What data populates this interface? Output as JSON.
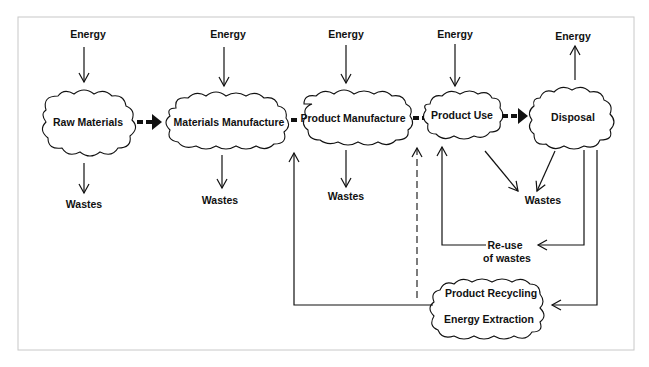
{
  "diagram": {
    "type": "life-cycle flow diagram",
    "stages": [
      {
        "id": "raw-materials",
        "label": "Raw Materials"
      },
      {
        "id": "materials-manufacture",
        "label": "Materials Manufacture"
      },
      {
        "id": "product-manufacture",
        "label": "Product Manufacture"
      },
      {
        "id": "product-use",
        "label": "Product Use"
      },
      {
        "id": "disposal",
        "label": "Disposal"
      }
    ],
    "energy_labels": [
      "Energy",
      "Energy",
      "Energy",
      "Energy",
      "Energy"
    ],
    "waste_labels": [
      "Wastes",
      "Wastes",
      "Wastes",
      "Wastes"
    ],
    "reuse": {
      "line1": "Re-use",
      "line2": "of wastes"
    },
    "recycling": {
      "line1": "Product Recycling",
      "line2": "Energy Extraction"
    },
    "edges": [
      {
        "from": "Energy",
        "to": "Raw Materials",
        "style": "solid"
      },
      {
        "from": "Energy",
        "to": "Materials Manufacture",
        "style": "solid"
      },
      {
        "from": "Energy",
        "to": "Product Manufacture",
        "style": "solid"
      },
      {
        "from": "Energy",
        "to": "Product Use",
        "style": "solid"
      },
      {
        "from": "Disposal",
        "to": "Energy",
        "style": "solid"
      },
      {
        "from": "Raw Materials",
        "to": "Materials Manufacture",
        "style": "bold-dashed"
      },
      {
        "from": "Materials Manufacture",
        "to": "Product Manufacture",
        "style": "bold-dashed"
      },
      {
        "from": "Product Manufacture",
        "to": "Product Use",
        "style": "bold-dashed"
      },
      {
        "from": "Product Use",
        "to": "Disposal",
        "style": "bold-dashed"
      },
      {
        "from": "Raw Materials",
        "to": "Wastes",
        "style": "solid"
      },
      {
        "from": "Materials Manufacture",
        "to": "Wastes",
        "style": "solid"
      },
      {
        "from": "Product Manufacture",
        "to": "Wastes",
        "style": "solid"
      },
      {
        "from": "Product Use",
        "to": "Wastes",
        "style": "solid"
      },
      {
        "from": "Disposal",
        "to": "Wastes",
        "style": "solid"
      },
      {
        "from": "Disposal",
        "to": "Re-use of wastes",
        "style": "solid"
      },
      {
        "from": "Re-use of wastes",
        "to": "Product Use",
        "style": "solid"
      },
      {
        "from": "Disposal",
        "to": "Product Recycling / Energy Extraction",
        "style": "solid"
      },
      {
        "from": "Product Recycling / Energy Extraction",
        "to": "Materials Manufacture",
        "style": "solid"
      },
      {
        "from": "Product Recycling / Energy Extraction",
        "to": "Product Manufacture",
        "style": "dashed"
      }
    ]
  }
}
